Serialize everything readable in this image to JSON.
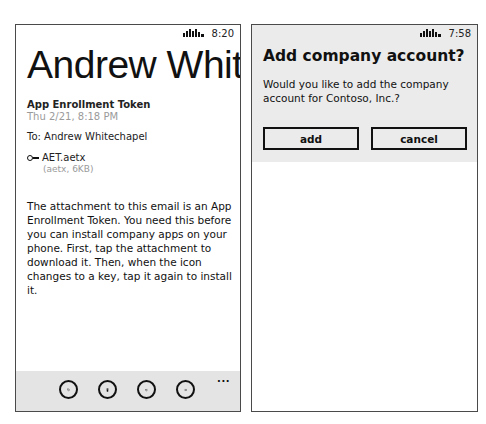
{
  "left_screen": {
    "status_bar": {
      "signal_icon": "signal-strength-icon",
      "time": "8:20"
    },
    "email": {
      "sender": "Andrew Whitechapel",
      "subject": "App Enrollment Token",
      "date": "Thu 2/21, 8:18 PM",
      "to": "To: Andrew Whitechapel",
      "attachment": {
        "icon": "key-icon",
        "name": "AET.aetx",
        "meta": "(aetx, 6KB)"
      },
      "body": "The attachment to this email is an App Enrollment Token. You need this before you can install company apps on your phone. First, tap the attachment to download it. Then, when the icon changes to a key, tap it again to install it."
    },
    "app_bar": {
      "buttons": [
        {
          "name": "reply",
          "icon": "reply-icon"
        },
        {
          "name": "delete",
          "icon": "trash-icon"
        },
        {
          "name": "previous",
          "icon": "arrow-left-icon"
        },
        {
          "name": "next",
          "icon": "arrow-right-icon"
        }
      ],
      "more": "..."
    }
  },
  "right_screen": {
    "status_bar": {
      "signal_icon": "signal-strength-icon",
      "time": "7:58"
    },
    "dialog": {
      "title": "Add company account?",
      "message": "Would you like to add the company account for Contoso, Inc.?",
      "buttons": {
        "add": "add",
        "cancel": "cancel"
      }
    }
  },
  "colors": {
    "frame_border": "#4a4a4a",
    "app_bar_bg": "#e4e4e4",
    "dialog_bg": "#ebebeb",
    "muted_text": "#9a9a9a",
    "text": "#111111"
  }
}
